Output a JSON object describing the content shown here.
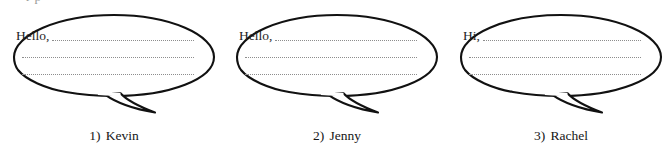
{
  "page": {
    "background_color": "#ffffff",
    "ink_color": "#1a1a1a",
    "dotted_line_color": "#8d8d8d",
    "width": 670,
    "height": 157,
    "top_clipped_text": "r  p"
  },
  "worksheet": {
    "kind": "speech-bubble-writing-exercise",
    "lines_per_bubble": 3,
    "bubbles": [
      {
        "index": 1,
        "greeting": "Hello,",
        "caption_number": "1)",
        "caption_name": "Kevin",
        "caption_full": "1) Kevin",
        "tail_direction": "down-right"
      },
      {
        "index": 2,
        "greeting": "Hello,",
        "caption_number": "2)",
        "caption_name": "Jenny",
        "caption_full": "2) Jenny",
        "tail_direction": "down-right"
      },
      {
        "index": 3,
        "greeting": "Hi,",
        "caption_number": "3)",
        "caption_name": "Rachel",
        "caption_full": "3) Rachel",
        "tail_direction": "down-right"
      }
    ]
  }
}
